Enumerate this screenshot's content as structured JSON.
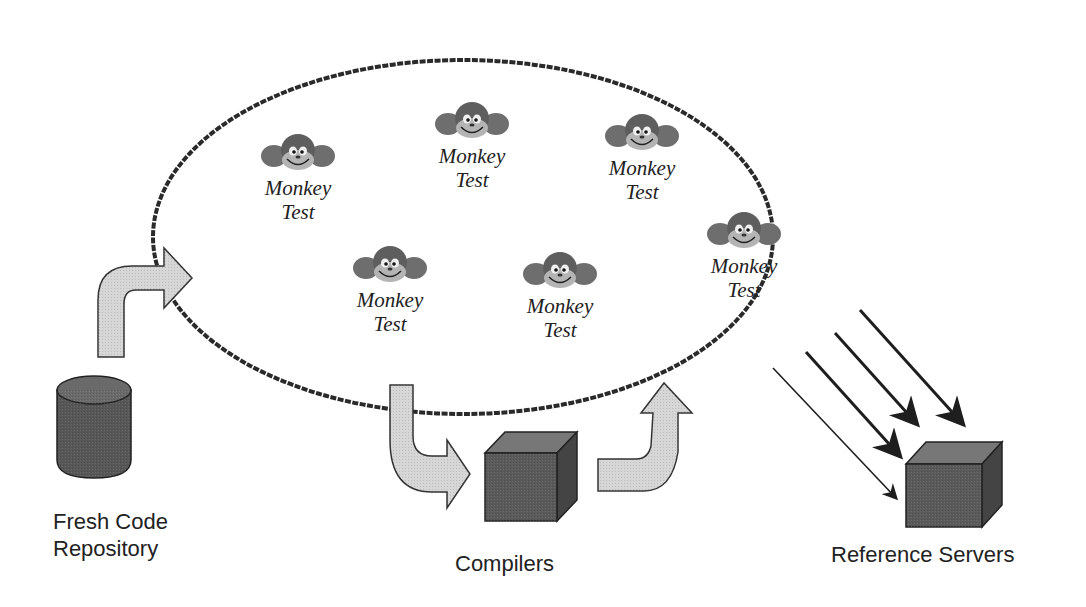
{
  "diagram": {
    "type": "monkey-testing-pipeline",
    "colors": {
      "ellipse_stroke": "#2a2a2a",
      "arrow_fill": "#d6d6d6",
      "box_front": "#5a5a5a",
      "box_top": "#7a7a7a",
      "box_side": "#464646",
      "background": "#ffffff"
    },
    "monkeys": [
      {
        "line1": "Monkey",
        "line2": "Test",
        "x": 248,
        "y": 132
      },
      {
        "line1": "Monkey",
        "line2": "Test",
        "x": 422,
        "y": 100
      },
      {
        "line1": "Monkey",
        "line2": "Test",
        "x": 592,
        "y": 112
      },
      {
        "line1": "Monkey",
        "line2": "Test",
        "x": 340,
        "y": 244
      },
      {
        "line1": "Monkey",
        "line2": "Test",
        "x": 510,
        "y": 250
      },
      {
        "line1": "Monkey",
        "line2": "Test",
        "x": 694,
        "y": 210
      }
    ],
    "nodes": {
      "repository": {
        "line1": "Fresh Code",
        "line2": "Repository"
      },
      "compilers": {
        "label": "Compilers"
      },
      "servers": {
        "label": "Reference Servers"
      }
    }
  }
}
